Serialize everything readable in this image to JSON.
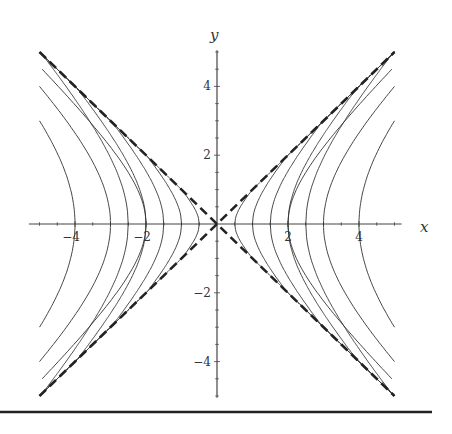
{
  "chart_data": {
    "type": "line",
    "title": "",
    "xlabel": "x",
    "ylabel": "y",
    "xlim": [
      -5,
      5
    ],
    "ylim": [
      -5,
      5
    ],
    "x_ticks": [
      -4,
      -2,
      2,
      4
    ],
    "y_ticks": [
      -4,
      -2,
      2,
      4
    ],
    "x_tick_labels": [
      "−4",
      "−2",
      "2",
      "4"
    ],
    "y_tick_labels": [
      "−4",
      "−2",
      "2",
      "4"
    ],
    "grid": false,
    "legend": null,
    "series": [
      {
        "name": "asymptote y = x",
        "style": "dashed",
        "x": [
          -5,
          5
        ],
        "y": [
          -5,
          5
        ]
      },
      {
        "name": "asymptote y = -x",
        "style": "dashed",
        "x": [
          -5,
          5
        ],
        "y": [
          5,
          -5
        ]
      },
      {
        "name": "steep branch, vertex ±0.5",
        "style": "solid",
        "vertex": 0.5
      },
      {
        "name": "steep branch, vertex ±1",
        "style": "solid",
        "vertex": 1.0
      },
      {
        "name": "steep branch, vertex ±1.5",
        "style": "solid",
        "vertex": 1.5
      },
      {
        "name": "steep branch, vertex ±2",
        "style": "solid",
        "vertex": 2.0
      },
      {
        "name": "steep branch, vertex ±2.5",
        "style": "solid",
        "vertex": 2.5
      },
      {
        "name": "x^2 - y^2 = 4 (ends at y≈±4.6 at x=±5)",
        "style": "solid",
        "c": 4
      },
      {
        "name": "x^2 - y^2 = 9 (ends at y=±4 at x=±5)",
        "style": "solid",
        "c": 9
      },
      {
        "name": "x^2 - y^2 = 16 (ends at y=±3 at x=±5)",
        "style": "solid",
        "c": 16
      }
    ],
    "steep_vertices": [
      0.5,
      1.0,
      1.5,
      2.0,
      2.5
    ],
    "flat_constants": [
      4,
      9,
      16
    ]
  },
  "layout": {
    "origin_px": [
      217,
      224
    ],
    "x_scale_px": 35.5,
    "y_scale_px": 34.4,
    "rule_y_px": 412,
    "rule_x_end_px": 432
  }
}
